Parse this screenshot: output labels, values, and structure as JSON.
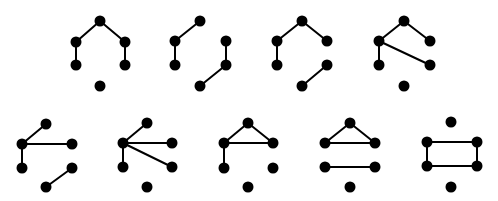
{
  "figure": {
    "colors": {
      "background": "#ffffff",
      "ink": "#000000"
    },
    "node_radius": 5.5,
    "edge_width": 2,
    "vertex_labels": [
      "top",
      "left-upper",
      "right-upper",
      "left-lower",
      "right-lower",
      "bottom"
    ]
  },
  "graphs": [
    {
      "id": "g1",
      "nodes": [
        [
          100,
          21
        ],
        [
          76,
          42
        ],
        [
          125,
          42
        ],
        [
          76,
          65
        ],
        [
          125,
          65
        ],
        [
          100,
          86
        ]
      ],
      "edges": [
        [
          0,
          1
        ],
        [
          0,
          2
        ],
        [
          1,
          3
        ],
        [
          2,
          4
        ]
      ]
    },
    {
      "id": "g2",
      "nodes": [
        [
          200,
          21
        ],
        [
          175,
          41
        ],
        [
          226,
          41
        ],
        [
          175,
          65
        ],
        [
          226,
          65
        ],
        [
          200,
          86
        ]
      ],
      "edges": [
        [
          0,
          1
        ],
        [
          1,
          3
        ],
        [
          2,
          4
        ],
        [
          4,
          5
        ]
      ]
    },
    {
      "id": "g3",
      "nodes": [
        [
          302,
          21
        ],
        [
          277,
          41
        ],
        [
          327,
          41
        ],
        [
          277,
          65
        ],
        [
          327,
          65
        ],
        [
          302,
          86
        ]
      ],
      "edges": [
        [
          0,
          1
        ],
        [
          0,
          2
        ],
        [
          1,
          3
        ],
        [
          4,
          5
        ]
      ]
    },
    {
      "id": "g4",
      "nodes": [
        [
          404,
          21
        ],
        [
          379,
          41
        ],
        [
          430,
          41
        ],
        [
          379,
          65
        ],
        [
          430,
          65
        ],
        [
          404,
          86
        ]
      ],
      "edges": [
        [
          0,
          1
        ],
        [
          0,
          2
        ],
        [
          1,
          3
        ],
        [
          1,
          4
        ]
      ]
    },
    {
      "id": "g5",
      "nodes": [
        [
          46,
          124
        ],
        [
          22,
          144
        ],
        [
          72,
          144
        ],
        [
          22,
          168
        ],
        [
          72,
          168
        ],
        [
          46,
          187
        ]
      ],
      "edges": [
        [
          0,
          1
        ],
        [
          1,
          2
        ],
        [
          1,
          3
        ],
        [
          4,
          5
        ]
      ]
    },
    {
      "id": "g6",
      "nodes": [
        [
          147,
          123
        ],
        [
          123,
          143
        ],
        [
          172,
          143
        ],
        [
          123,
          167
        ],
        [
          172,
          167
        ],
        [
          147,
          187
        ]
      ],
      "edges": [
        [
          1,
          0
        ],
        [
          1,
          2
        ],
        [
          1,
          4
        ],
        [
          1,
          3
        ]
      ]
    },
    {
      "id": "g7",
      "nodes": [
        [
          248,
          123
        ],
        [
          224,
          143
        ],
        [
          273,
          143
        ],
        [
          224,
          168
        ],
        [
          273,
          168
        ],
        [
          248,
          187
        ]
      ],
      "edges": [
        [
          0,
          1
        ],
        [
          0,
          2
        ],
        [
          1,
          2
        ],
        [
          1,
          3
        ]
      ]
    },
    {
      "id": "g8",
      "nodes": [
        [
          350,
          123
        ],
        [
          325,
          143
        ],
        [
          375,
          143
        ],
        [
          325,
          167
        ],
        [
          375,
          167
        ],
        [
          350,
          187
        ]
      ],
      "edges": [
        [
          0,
          1
        ],
        [
          0,
          2
        ],
        [
          1,
          2
        ],
        [
          3,
          4
        ]
      ]
    },
    {
      "id": "g9",
      "nodes": [
        [
          451,
          122
        ],
        [
          427,
          142
        ],
        [
          477,
          142
        ],
        [
          427,
          166
        ],
        [
          477,
          166
        ],
        [
          451,
          187
        ]
      ],
      "edges": [
        [
          1,
          2
        ],
        [
          2,
          4
        ],
        [
          4,
          3
        ],
        [
          3,
          1
        ]
      ]
    }
  ]
}
